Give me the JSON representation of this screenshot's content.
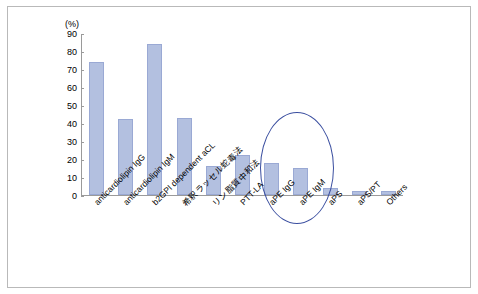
{
  "chart_data": {
    "type": "bar",
    "title": "",
    "unit_label": "(%)",
    "xlabel": "",
    "ylabel": "",
    "ylim": [
      0,
      90
    ],
    "yticks": [
      0,
      10,
      20,
      30,
      40,
      50,
      60,
      70,
      80,
      90
    ],
    "grid": false,
    "legend": false,
    "categories": [
      "anticardiolipin IgG",
      "anticardiolipin IgM",
      "b2GPI dependent aCL",
      "希釈ラッセル蛇毒法",
      "リン脂質中和法",
      "PTT-LA",
      "aPE IgG",
      "aPE IgM",
      "aPS",
      "aPS/PT",
      "Others"
    ],
    "values": [
      74,
      42,
      84,
      43,
      16,
      22,
      18,
      15,
      4,
      2,
      2
    ],
    "bar_color": "#b3c0e0",
    "bar_border_color": "#9aa9d4",
    "annotations": [
      {
        "name": "highlight-ellipse",
        "shape": "ellipse",
        "color": "#3b4fa0",
        "covers": [
          "希釈ラッセル蛇毒法",
          "リン脂質中和法"
        ]
      }
    ]
  }
}
